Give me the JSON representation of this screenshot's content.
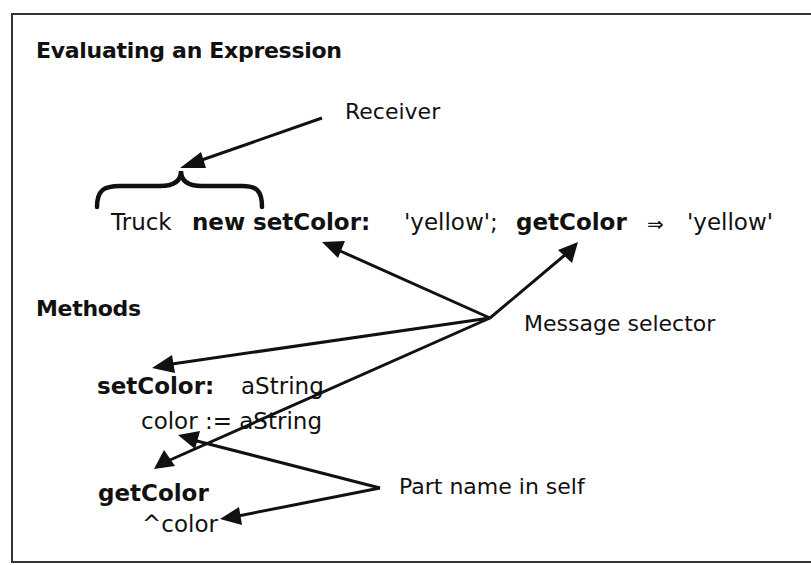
{
  "diagram": {
    "title": "Evaluating an Expression",
    "receiver_label": "Receiver",
    "expression": {
      "receiver": "Truck",
      "creation": "new",
      "selector1": "setColor:",
      "argument1": "'yellow';",
      "selector2": "getColor",
      "yields_symbol": "⇒",
      "result": "'yellow'"
    },
    "methods_heading": "Methods",
    "message_selector_label": "Message selector",
    "part_name_label": "Part name in self",
    "methods": [
      {
        "signature": "setColor:",
        "param": "aString",
        "body": "color := aString"
      },
      {
        "signature": "getColor",
        "param": "",
        "body": "^color"
      }
    ],
    "colors": {
      "ink": "#111111",
      "frame": "#333333",
      "background": "#ffffff"
    }
  }
}
